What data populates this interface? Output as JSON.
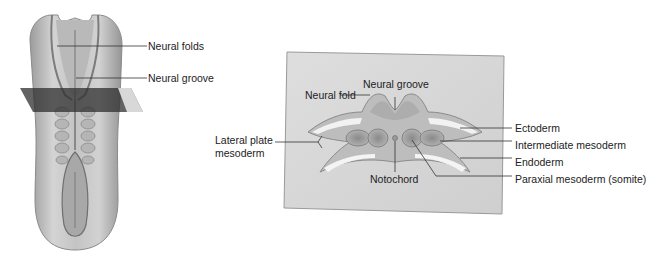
{
  "figure": {
    "left_panel": {
      "description": "Dorsal view of embryo with transverse section plane",
      "labels": {
        "neural_folds": "Neural folds",
        "neural_groove": "Neural groove"
      }
    },
    "right_panel": {
      "description": "Transverse cross-section of embryo",
      "labels": {
        "neural_groove": "Neural groove",
        "neural_fold": "Neural fold",
        "lateral_plate_line1": "Lateral plate",
        "lateral_plate_line2": "mesoderm",
        "notochord": "Notochord",
        "ectoderm": "Ectoderm",
        "intermediate_mesoderm": "Intermediate mesoderm",
        "endoderm": "Endoderm",
        "paraxial_mesoderm": "Paraxial mesoderm (somite)"
      }
    },
    "colors": {
      "embryo_fill": "#c9c9c9",
      "embryo_shadow": "#8f8f8f",
      "section_plane": "#3a3a3a",
      "section_box": "#d9d9d9",
      "mesoderm": "#9a9a9a",
      "leader_line": "#333333"
    }
  }
}
